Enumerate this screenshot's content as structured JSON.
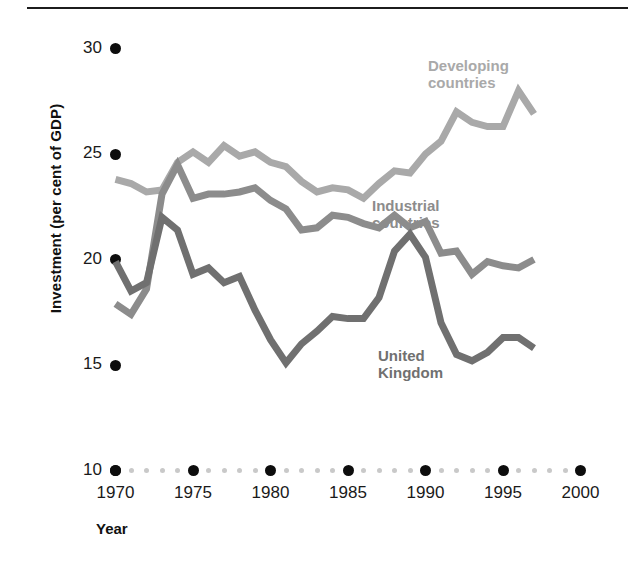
{
  "chart_data": {
    "type": "line",
    "title": "",
    "xlabel": "Year",
    "ylabel": "Investment (per cent of GDP)",
    "xlim": [
      1970,
      2000
    ],
    "ylim": [
      10,
      30
    ],
    "yticks": [
      10,
      15,
      20,
      25,
      30
    ],
    "ytick_labels": [
      "10",
      "15",
      "20",
      "25",
      "30"
    ],
    "xticks": [
      1970,
      1975,
      1980,
      1985,
      1990,
      1995,
      2000
    ],
    "xtick_labels": [
      "1970",
      "1975",
      "1980",
      "1985",
      "1990",
      "1995",
      "2000"
    ],
    "grid": false,
    "legend_position": "inline-annotations",
    "x": [
      1970,
      1971,
      1972,
      1973,
      1974,
      1975,
      1976,
      1977,
      1978,
      1979,
      1980,
      1981,
      1982,
      1983,
      1984,
      1985,
      1986,
      1987,
      1988,
      1989,
      1990,
      1991,
      1992,
      1993,
      1994,
      1995,
      1996,
      1997
    ],
    "series": [
      {
        "name": "Developing countries",
        "color": "#a9a9a9",
        "values": [
          23.8,
          23.6,
          23.2,
          23.3,
          24.6,
          25.1,
          24.6,
          25.4,
          24.9,
          25.1,
          24.6,
          24.4,
          23.7,
          23.2,
          23.4,
          23.3,
          22.9,
          23.6,
          24.2,
          24.1,
          25.0,
          25.6,
          27.0,
          26.5,
          26.3,
          26.3,
          28.0,
          26.9
        ]
      },
      {
        "name": "Industrial countries",
        "color": "#8c8c8c",
        "values": [
          17.9,
          17.4,
          18.6,
          23.1,
          24.5,
          22.9,
          23.1,
          23.1,
          23.2,
          23.4,
          22.8,
          22.4,
          21.4,
          21.5,
          22.1,
          22.0,
          21.7,
          21.5,
          22.1,
          21.5,
          21.8,
          20.3,
          20.4,
          19.3,
          19.9,
          19.7,
          19.6,
          20.0
        ]
      },
      {
        "name": "United Kingdom",
        "color": "#707070",
        "values": [
          19.9,
          18.5,
          18.9,
          22.0,
          21.4,
          19.3,
          19.6,
          18.9,
          19.2,
          17.6,
          16.2,
          15.1,
          16.0,
          16.6,
          17.3,
          17.2,
          17.2,
          18.2,
          20.4,
          21.2,
          20.1,
          17.0,
          15.5,
          15.2,
          15.6,
          16.3,
          16.3,
          15.8
        ]
      }
    ],
    "annotations": [
      {
        "text": "Developing\ncountries",
        "series": "Developing countries",
        "color": "#a9a9a9"
      },
      {
        "text": "Industrial\ncountries",
        "series": "Industrial countries",
        "color": "#8c8c8c"
      },
      {
        "text": "United\nKingdom",
        "series": "United Kingdom",
        "color": "#707070"
      }
    ]
  }
}
